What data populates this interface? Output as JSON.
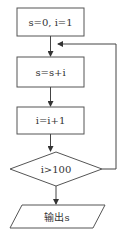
{
  "flowchart": {
    "nodes": [
      {
        "id": "init",
        "type": "process",
        "label": "s=0,  i=1"
      },
      {
        "id": "accumulate",
        "type": "process",
        "label": "s=s+i"
      },
      {
        "id": "increment",
        "type": "process",
        "label": "i=i+1"
      },
      {
        "id": "condition",
        "type": "decision",
        "label": "i>100"
      },
      {
        "id": "output",
        "type": "io",
        "label": "输出s"
      }
    ],
    "edges": [
      {
        "from": "init",
        "to": "accumulate"
      },
      {
        "from": "accumulate",
        "to": "increment"
      },
      {
        "from": "increment",
        "to": "condition"
      },
      {
        "from": "condition",
        "to": "output"
      },
      {
        "from": "condition",
        "to": "accumulate",
        "note": "loop back"
      }
    ]
  },
  "colors": {
    "stroke": "#555555",
    "background": "#ffffff"
  }
}
